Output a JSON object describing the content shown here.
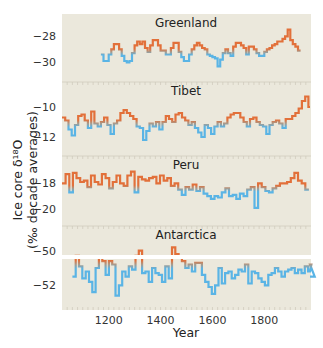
{
  "chart_data": {
    "type": "line",
    "style": "step",
    "title": "",
    "xlabel": "Year",
    "ylabel": "Ice core δ¹⁸O",
    "ylabel_sub": "(‰ decade averages)",
    "xlim": [
      1020,
      1980
    ],
    "xticks": [
      1200,
      1400,
      1600,
      1800
    ],
    "grid": false,
    "legend": null,
    "colors": {
      "warm": "#e2703a",
      "cold": "#5ab4e5",
      "neutral": "#a89a8c",
      "panel_bg": "#ebe8dc",
      "separator": "#ffffff"
    },
    "panels": [
      {
        "name": "Greenland",
        "yticks": [
          -28,
          -30
        ],
        "ylim": [
          -31.2,
          -26.6
        ],
        "mean": -29.2,
        "start": 1170,
        "values": [
          -29.4,
          -29.9,
          -29.9,
          -29.4,
          -29.0,
          -28.6,
          -28.6,
          -29.0,
          -29.5,
          -29.9,
          -30.0,
          -29.9,
          -29.3,
          -28.7,
          -28.4,
          -28.6,
          -28.4,
          -28.9,
          -29.2,
          -28.7,
          -28.3,
          -28.3,
          -28.7,
          -29.1,
          -29.1,
          -29.4,
          -29.4,
          -28.9,
          -28.5,
          -28.5,
          -29.2,
          -29.6,
          -29.9,
          -29.9,
          -29.4,
          -29.0,
          -28.7,
          -28.5,
          -28.7,
          -28.9,
          -29.0,
          -29.4,
          -29.5,
          -29.6,
          -29.7,
          -30.3,
          -29.8,
          -29.3,
          -29.0,
          -29.3,
          -29.5,
          -28.8,
          -28.5,
          -28.5,
          -28.7,
          -28.9,
          -29.4,
          -28.8,
          -28.8,
          -29.0,
          -29.3,
          -29.5,
          -29.5,
          -29.2,
          -29.0,
          -28.9,
          -28.7,
          -28.6,
          -28.4,
          -28.4,
          -28.2,
          -28.0,
          -27.5,
          -28.3,
          -28.6,
          -28.8,
          -29.1
        ],
        "step": 10
      },
      {
        "name": "Tibet",
        "yticks": [
          -10,
          -12
        ],
        "ylim": [
          -13.0,
          -8.6
        ],
        "mean": -11.1,
        "start": 1020,
        "values": [
          -10.7,
          -10.9,
          -11.5,
          -11.9,
          -11.2,
          -10.6,
          -10.5,
          -10.9,
          -11.4,
          -10.3,
          -11.1,
          -11.3,
          -11.0,
          -10.7,
          -11.2,
          -11.8,
          -11.1,
          -10.9,
          -10.4,
          -10.2,
          -10.4,
          -10.6,
          -10.8,
          -11.3,
          -11.4,
          -12.2,
          -11.6,
          -11.1,
          -11.3,
          -11.0,
          -11.5,
          -11.0,
          -10.6,
          -10.8,
          -11.0,
          -10.5,
          -10.4,
          -10.7,
          -10.9,
          -11.2,
          -11.0,
          -11.4,
          -11.7,
          -12.0,
          -11.2,
          -11.4,
          -11.8,
          -11.3,
          -11.0,
          -11.3,
          -11.1,
          -10.7,
          -10.5,
          -10.4,
          -10.4,
          -10.7,
          -11.0,
          -11.3,
          -10.8,
          -10.7,
          -11.0,
          -11.2,
          -11.3,
          -11.8,
          -11.2,
          -11.0,
          -10.9,
          -11.1,
          -11.4,
          -10.8,
          -10.8,
          -10.6,
          -10.4,
          -10.1,
          -9.6,
          -9.3,
          -10.0
        ],
        "step": 12.5
      },
      {
        "name": "Peru",
        "yticks": [
          -18,
          -20
        ],
        "ylim": [
          -21.0,
          -16.2
        ],
        "mean": -18.4,
        "start": 1020,
        "values": [
          -18.0,
          -17.3,
          -18.7,
          -17.2,
          -17.6,
          -17.9,
          -17.8,
          -18.3,
          -17.4,
          -17.9,
          -18.1,
          -17.3,
          -17.6,
          -18.4,
          -17.9,
          -17.4,
          -18.0,
          -18.2,
          -17.4,
          -17.1,
          -18.7,
          -17.5,
          -17.7,
          -17.8,
          -17.6,
          -17.5,
          -18.0,
          -17.4,
          -17.8,
          -17.6,
          -18.2,
          -18.0,
          -18.5,
          -18.9,
          -18.3,
          -18.5,
          -18.1,
          -18.6,
          -18.3,
          -18.8,
          -19.0,
          -19.2,
          -19.0,
          -19.1,
          -18.7,
          -18.4,
          -19.0,
          -18.9,
          -19.2,
          -18.8,
          -19.0,
          -18.5,
          -18.3,
          -19.9,
          -18.0,
          -18.3,
          -18.6,
          -18.7,
          -18.4,
          -18.2,
          -18.0,
          -18.0,
          -17.9,
          -17.6,
          -17.2,
          -17.8,
          -18.0,
          -18.5
        ],
        "step": 14
      },
      {
        "name": "Antarctica",
        "yticks": [
          -50,
          -52
        ],
        "ylim": [
          -53.2,
          -48.8
        ],
        "mean": -50.8,
        "start": 1060,
        "values": [
          -51.5,
          -50.3,
          -50.9,
          -51.6,
          -51.2,
          -51.8,
          -52.4,
          -51.0,
          -50.4,
          -50.6,
          -51.4,
          -50.6,
          -50.8,
          -52.6,
          -52.0,
          -51.2,
          -51.5,
          -50.9,
          -51.1,
          -50.3,
          -50.0,
          -51.3,
          -51.2,
          -51.8,
          -51.0,
          -51.3,
          -51.4,
          -51.8,
          -50.9,
          -51.6,
          -49.8,
          -50.2,
          -50.4,
          -50.6,
          -51.0,
          -50.8,
          -51.2,
          -50.7,
          -50.7,
          -51.4,
          -51.8,
          -52.1,
          -52.5,
          -52.0,
          -51.0,
          -51.9,
          -51.3,
          -51.2,
          -51.6,
          -51.4,
          -51.1,
          -51.2,
          -50.8,
          -51.9,
          -51.2,
          -51.3,
          -51.6,
          -51.8,
          -52.0,
          -51.4,
          -51.3,
          -51.0,
          -51.2,
          -51.5,
          -51.2,
          -51.1,
          -51.0,
          -51.3,
          -51.1,
          -51.3,
          -50.9,
          -51.2,
          -50.8,
          -51.5
        ],
        "step": 12.8
      }
    ]
  },
  "labels": {
    "xlabel": "Year",
    "ylabel_line1": "Ice core δ¹⁸O",
    "ylabel_line2": "(‰ decade averages)"
  }
}
